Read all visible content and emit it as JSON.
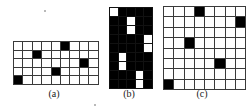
{
  "figure": {
    "background_color": "#ffffff",
    "cell_on_color": "#000000",
    "cell_off_color": "#ffffff",
    "grid_line_color": "#3a3a3a",
    "caption_color": "#1a1a1a"
  },
  "panels": [
    {
      "id": "a",
      "caption": "(a)",
      "columns": 9,
      "rows": 5,
      "inverted": false,
      "filled_cells": [
        [
          0,
          5
        ],
        [
          1,
          2
        ],
        [
          2,
          7
        ],
        [
          3,
          4
        ],
        [
          4,
          0
        ]
      ],
      "matrix": [
        [
          0,
          0,
          0,
          0,
          0,
          1,
          0,
          0,
          0
        ],
        [
          0,
          0,
          1,
          0,
          0,
          0,
          0,
          0,
          0
        ],
        [
          0,
          0,
          0,
          0,
          0,
          0,
          0,
          1,
          0
        ],
        [
          0,
          0,
          0,
          0,
          1,
          0,
          0,
          0,
          0
        ],
        [
          1,
          0,
          0,
          0,
          0,
          0,
          0,
          0,
          0
        ]
      ]
    },
    {
      "id": "b",
      "caption": "(b)",
      "columns": 5,
      "rows": 9,
      "inverted": true,
      "white_cells": [
        [
          0,
          0
        ],
        [
          1,
          2
        ],
        [
          2,
          2
        ],
        [
          3,
          4
        ],
        [
          4,
          4
        ],
        [
          5,
          1
        ],
        [
          6,
          1
        ],
        [
          7,
          3
        ],
        [
          8,
          3
        ]
      ],
      "matrix": [
        [
          1,
          0,
          0,
          0,
          0
        ],
        [
          0,
          0,
          1,
          0,
          0
        ],
        [
          0,
          0,
          1,
          0,
          0
        ],
        [
          0,
          0,
          0,
          0,
          1
        ],
        [
          0,
          0,
          0,
          0,
          1
        ],
        [
          0,
          1,
          0,
          0,
          0
        ],
        [
          0,
          1,
          0,
          0,
          0
        ],
        [
          0,
          0,
          0,
          1,
          0
        ],
        [
          0,
          0,
          0,
          1,
          0
        ]
      ]
    },
    {
      "id": "c",
      "caption": "(c)",
      "columns": 8,
      "rows": 8,
      "inverted": false,
      "filled_cells": [
        [
          0,
          3
        ],
        [
          1,
          7
        ],
        [
          3,
          2
        ],
        [
          5,
          5
        ],
        [
          7,
          0
        ]
      ],
      "matrix": [
        [
          0,
          0,
          0,
          1,
          0,
          0,
          0,
          0
        ],
        [
          0,
          0,
          0,
          0,
          0,
          0,
          0,
          1
        ],
        [
          0,
          0,
          0,
          0,
          0,
          0,
          0,
          0
        ],
        [
          0,
          0,
          1,
          0,
          0,
          0,
          0,
          0
        ],
        [
          0,
          0,
          0,
          0,
          0,
          0,
          0,
          0
        ],
        [
          0,
          0,
          0,
          0,
          0,
          1,
          0,
          0
        ],
        [
          0,
          0,
          0,
          0,
          0,
          0,
          0,
          0
        ],
        [
          1,
          0,
          0,
          0,
          0,
          0,
          0,
          0
        ]
      ]
    }
  ]
}
